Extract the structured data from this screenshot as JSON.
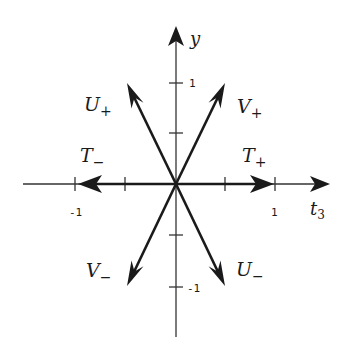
{
  "diagram": {
    "axes": {
      "x_label": "t",
      "x_label_sub": "3",
      "y_label": "y",
      "x_ticks": [
        {
          "value": -1,
          "label": "-1"
        },
        {
          "value": -0.5,
          "label": ""
        },
        {
          "value": 0.5,
          "label": ""
        },
        {
          "value": 1,
          "label": "1"
        }
      ],
      "y_ticks": [
        {
          "value": 1,
          "label": "1"
        },
        {
          "value": 0.5,
          "label": ""
        },
        {
          "value": -0.5,
          "label": ""
        },
        {
          "value": -1,
          "label": "-1"
        }
      ]
    },
    "vectors": [
      {
        "name": "T+",
        "base": "T",
        "sub": "+",
        "x": 1,
        "y": 0
      },
      {
        "name": "T-",
        "base": "T",
        "sub": "−",
        "x": -1,
        "y": 0
      },
      {
        "name": "U+",
        "base": "U",
        "sub": "+",
        "x": -0.5,
        "y": 1
      },
      {
        "name": "U-",
        "base": "U",
        "sub": "−",
        "x": 0.5,
        "y": -1
      },
      {
        "name": "V+",
        "base": "V",
        "sub": "+",
        "x": 0.5,
        "y": 1
      },
      {
        "name": "V-",
        "base": "V",
        "sub": "−",
        "x": -0.5,
        "y": -1
      }
    ],
    "colors": {
      "ink": "#1a1a1a",
      "axis": "#333333",
      "background": "#ffffff"
    }
  }
}
